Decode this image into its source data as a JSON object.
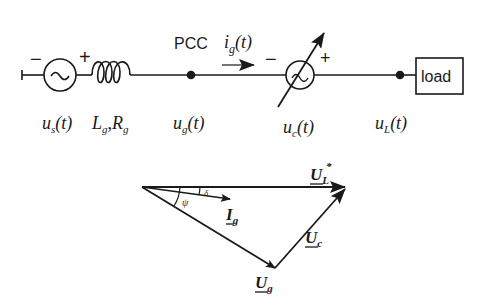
{
  "circuit": {
    "source_minus": "−",
    "source_plus": "+",
    "source_symbol": "~",
    "pcc_label": "PCC",
    "current_label": "i",
    "current_sub": "g",
    "current_arg": "(t)",
    "comp_minus": "−",
    "comp_plus": "+",
    "load_label": "load",
    "labels": {
      "us": {
        "main": "u",
        "sub": "s",
        "arg": "(t)"
      },
      "lg": {
        "main": "L",
        "sub": "g",
        "sep": ",",
        "main2": "R",
        "sub2": "g"
      },
      "ug": {
        "main": "u",
        "sub": "g",
        "arg": "(t)"
      },
      "uc": {
        "main": "u",
        "sub": "c",
        "arg": "(t)"
      },
      "ul": {
        "main": "u",
        "sub": "L",
        "arg": "(t)"
      }
    }
  },
  "phasor": {
    "ul_star": {
      "main": "U",
      "sub": "L",
      "sup": "*"
    },
    "ig": {
      "main": "I",
      "sub": "g"
    },
    "ug": {
      "main": "U",
      "sub": "g"
    },
    "uc": {
      "main": "U",
      "sub": "c"
    },
    "angle_delta": "δ",
    "angle_psi": "ψ"
  },
  "colors": {
    "ink": "#1a1a1a",
    "background": "#ffffff"
  }
}
